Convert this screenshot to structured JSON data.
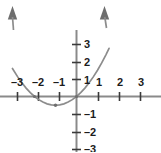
{
  "chart_data": {
    "type": "line",
    "title": "",
    "subtitle": "",
    "xlabel": "",
    "ylabel": "",
    "xlim": [
      -3.65,
      4.0
    ],
    "ylim": [
      -3.3,
      3.3
    ],
    "grid": false,
    "legend": false,
    "legend_position": "none",
    "x_ticks": [
      -3,
      -2,
      -1,
      1,
      2,
      3
    ],
    "y_ticks": [
      3,
      2,
      1,
      -1,
      -2,
      -3
    ],
    "x_tick_labels": [
      "–3",
      "–2",
      "–1",
      "1",
      "2",
      "3"
    ],
    "y_tick_labels": [
      "3",
      "2",
      "1",
      "–1",
      "–2",
      "–3"
    ],
    "series": [
      {
        "name": "parabola",
        "equation": "y = 0.5x² + x",
        "color": "#8c8c8c",
        "arrow_start": "up",
        "arrow_end": "up",
        "x": [
          -3.05,
          -2.8,
          -2.6,
          -2.4,
          -2.2,
          -2.0,
          -1.8,
          -1.6,
          -1.4,
          -1.2,
          -1.0,
          -0.8,
          -0.6,
          -0.4,
          -0.2,
          0.0,
          0.2,
          0.4,
          0.6,
          0.8,
          1.0,
          1.2,
          1.4,
          1.55
        ],
        "y": [
          1.6,
          1.12,
          0.78,
          0.48,
          0.22,
          0.0,
          -0.18,
          -0.32,
          -0.42,
          -0.48,
          -0.5,
          -0.48,
          -0.42,
          -0.32,
          -0.18,
          0.0,
          0.22,
          0.48,
          0.78,
          1.12,
          1.5,
          1.92,
          2.38,
          2.75
        ]
      }
    ],
    "points": [
      {
        "name": "vertex",
        "x": -1,
        "y": -0.5,
        "color": "#6e6e6e"
      },
      {
        "name": "x-intercept-left",
        "x": -2,
        "y": 0,
        "color": "#6e6e6e"
      },
      {
        "name": "origin-intercept",
        "x": 0,
        "y": 0,
        "color": "#6e6e6e"
      }
    ],
    "axis_color": "#8a8a8a",
    "tick_color": "#3a3a3a",
    "label_color": "#1c1c1c",
    "background": "#ffffff"
  },
  "labels": {
    "x_neg": [
      {
        "text": "–3",
        "left": 17,
        "top": 88
      },
      {
        "text": "–2",
        "left": 38,
        "top": 88
      },
      {
        "text": "–1",
        "left": 59,
        "top": 88
      }
    ],
    "x_pos": [
      {
        "text": "1",
        "left": 99,
        "top": 88
      },
      {
        "text": "2",
        "left": 120,
        "top": 88
      },
      {
        "text": "3",
        "left": 141,
        "top": 88
      }
    ],
    "y_pos": [
      {
        "text": "3",
        "left": 84,
        "top": 44
      },
      {
        "text": "2",
        "left": 84,
        "top": 62
      },
      {
        "text": "1",
        "left": 84,
        "top": 80
      }
    ],
    "y_neg": [
      {
        "text": "–1",
        "left": 84,
        "top": 114
      },
      {
        "text": "–2",
        "left": 84,
        "top": 132
      },
      {
        "text": "–3",
        "left": 84,
        "top": 149
      }
    ]
  }
}
